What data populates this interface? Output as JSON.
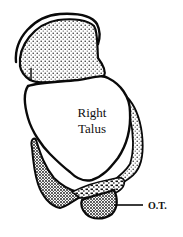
{
  "diagram": {
    "bone_label_line1": "Right",
    "bone_label_line2": "Talus",
    "callout_label": "O.T.",
    "colors": {
      "outline": "#0a0a0a",
      "fill": "#ffffff",
      "stipple": "#222222"
    }
  }
}
